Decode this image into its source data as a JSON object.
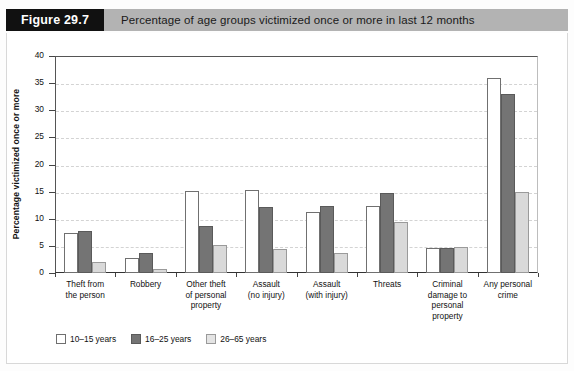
{
  "figure": {
    "tag": "Figure 29.7",
    "title": "Percentage of age groups victimized once or more in last 12 months"
  },
  "chart_data": {
    "type": "bar",
    "title": "Percentage of age groups victimized once or more in last 12 months",
    "xlabel": "",
    "ylabel": "Percentage victimized once or more",
    "ylim": [
      0,
      40
    ],
    "yticks": [
      0,
      5,
      10,
      15,
      20,
      25,
      30,
      35,
      40
    ],
    "ytick_labels": [
      "0",
      "5",
      "10",
      "15",
      "20",
      "25",
      "30",
      "35",
      "40"
    ],
    "grid": true,
    "legend_position": "below-left",
    "categories": [
      "Theft from the person",
      "Robbery",
      "Other theft of personal property",
      "Assault (no injury)",
      "Assault (with injury)",
      "Threats",
      "Criminal damage to personal property",
      "Any personal crime"
    ],
    "category_lines": [
      [
        "Theft from",
        "the person"
      ],
      [
        "Robbery"
      ],
      [
        "Other theft",
        "of personal",
        "property"
      ],
      [
        "Assault",
        "(no injury)"
      ],
      [
        "Assault",
        "(with injury)"
      ],
      [
        "Threats"
      ],
      [
        "Criminal",
        "damage to",
        "personal",
        "property"
      ],
      [
        "Any personal",
        "crime"
      ]
    ],
    "series": [
      {
        "name": "10–15 years",
        "color": "#ffffff",
        "values": [
          7.4,
          2.8,
          15.2,
          15.3,
          11.3,
          12.4,
          4.7,
          36.0
        ]
      },
      {
        "name": "16–25 years",
        "color": "#747474",
        "values": [
          7.7,
          3.7,
          8.6,
          12.2,
          12.4,
          14.7,
          4.7,
          33.0
        ]
      },
      {
        "name": "26–65 years",
        "color": "#d9d9d9",
        "values": [
          2.0,
          0.8,
          5.2,
          4.4,
          3.6,
          9.4,
          4.8,
          15.0
        ]
      }
    ]
  }
}
